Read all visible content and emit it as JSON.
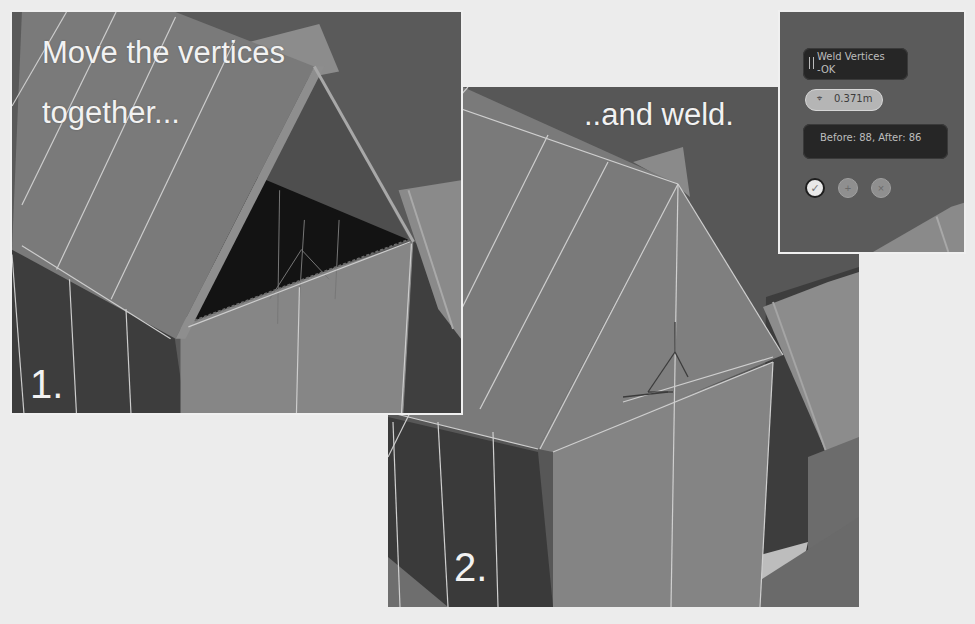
{
  "step1": {
    "caption_line1": "Move the vertices",
    "caption_line2": "together...",
    "step_number": "1."
  },
  "step2": {
    "caption": "..and weld.",
    "step_number": "2."
  },
  "weld_panel": {
    "title_line1": "Weld Vertices",
    "title_line2": "-OK",
    "threshold_icon": "weld-distance-icon",
    "threshold_value": "0.371m",
    "result_text": "Before: 88, After: 86",
    "buttons": [
      {
        "name": "confirm",
        "icon": "checkmark-icon",
        "glyph": "✓"
      },
      {
        "name": "add",
        "icon": "plus-icon",
        "glyph": "+"
      },
      {
        "name": "cancel",
        "icon": "close-icon",
        "glyph": "×"
      }
    ]
  },
  "colors": {
    "background": "#ececec",
    "panel_border": "#f0f0f0",
    "roof_face": "#7a7a7a",
    "wall_light": "#838383",
    "wall_dark": "#3c3c3c",
    "gap_interior": "#121212",
    "wireframe": "#cfcfcf",
    "osd_box": "#262626",
    "osd_pill": "#b5b5b5"
  }
}
